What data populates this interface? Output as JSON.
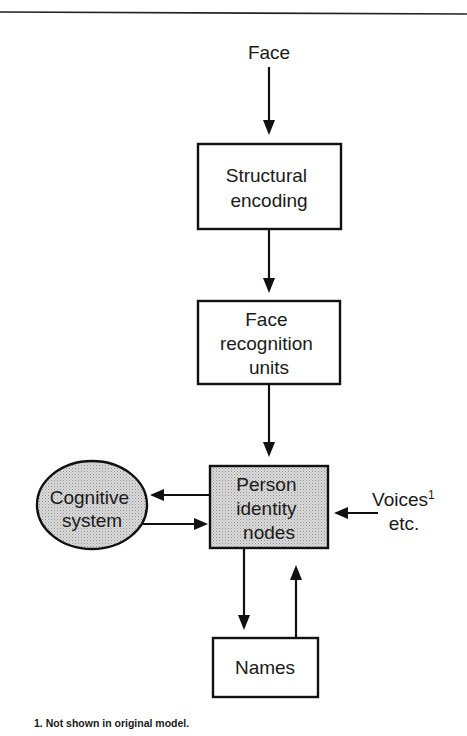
{
  "diagram": {
    "type": "flowchart",
    "title": "",
    "colors": {
      "line": "#111111",
      "text": "#1a1a1a",
      "shade_base": "#d9d9d9",
      "shade_dot": "#9a9a9a",
      "background": "#ffffff"
    },
    "nodes": {
      "face_input": {
        "label": "Face",
        "shape": "text"
      },
      "structural_encoding": {
        "lines": [
          "Structural",
          "encoding"
        ],
        "shape": "rectangle",
        "shaded": false
      },
      "face_recognition_units": {
        "lines": [
          "Face",
          "recognition",
          "units"
        ],
        "shape": "rectangle",
        "shaded": false
      },
      "person_identity_nodes": {
        "lines": [
          "Person",
          "identity",
          "nodes"
        ],
        "shape": "rectangle",
        "shaded": true
      },
      "cognitive_system": {
        "lines": [
          "Cognitive",
          "system"
        ],
        "shape": "ellipse",
        "shaded": true
      },
      "voices": {
        "lines": [
          "Voices",
          "etc."
        ],
        "superscript": "1",
        "shape": "text"
      },
      "names": {
        "label": "Names",
        "shape": "rectangle",
        "shaded": false
      }
    },
    "edges": [
      {
        "from": "face_input",
        "to": "structural_encoding"
      },
      {
        "from": "structural_encoding",
        "to": "face_recognition_units"
      },
      {
        "from": "face_recognition_units",
        "to": "person_identity_nodes"
      },
      {
        "from": "person_identity_nodes",
        "to": "cognitive_system"
      },
      {
        "from": "cognitive_system",
        "to": "person_identity_nodes"
      },
      {
        "from": "voices",
        "to": "person_identity_nodes"
      },
      {
        "from": "person_identity_nodes",
        "to": "names"
      },
      {
        "from": "names",
        "to": "person_identity_nodes"
      }
    ],
    "footnote": "1. Not shown in original model."
  }
}
